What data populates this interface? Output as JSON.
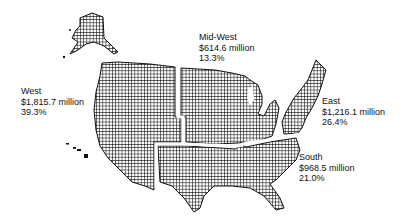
{
  "map": {
    "type": "us-regions",
    "fill_pattern": "crosshatch",
    "colors": {
      "fill": "#1a1a1a",
      "background": "#ffffff",
      "divider": "#ffffff"
    },
    "regions": [
      {
        "name": "West",
        "value": "$1,815.7 million",
        "percent": "39.3%"
      },
      {
        "name": "Mid-West",
        "value": "$614.6 million",
        "percent": "13.3%"
      },
      {
        "name": "East",
        "value": "$1,216.1 million",
        "percent": "26.4%"
      },
      {
        "name": "South",
        "value": "$968.5 million",
        "percent": "21.0%"
      }
    ]
  }
}
